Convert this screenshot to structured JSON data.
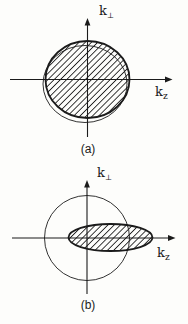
{
  "colors": {
    "ink": "#1b1b1b",
    "background": "#fdfdfb"
  },
  "figure_a": {
    "caption": "(a)",
    "y_axis_label": {
      "base": "k",
      "subscript": "⊥"
    },
    "x_axis_label": {
      "base": "k",
      "subscript": "z"
    }
  },
  "figure_b": {
    "caption": "(b)",
    "y_axis_label": {
      "base": "k",
      "subscript": "⊥"
    },
    "x_axis_label": {
      "base": "k",
      "subscript": "z"
    }
  }
}
